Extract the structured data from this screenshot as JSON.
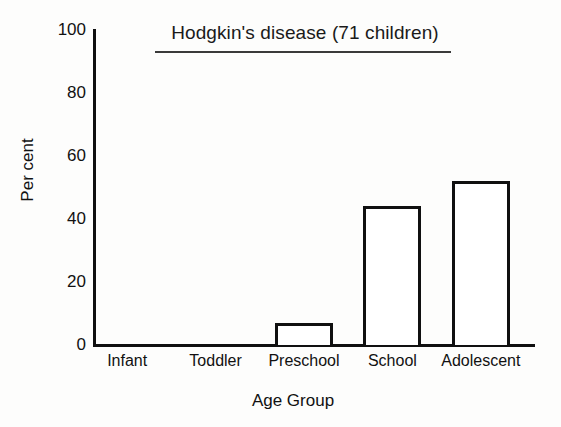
{
  "chart_data": {
    "type": "bar",
    "title": "Hodgkin's disease (71 children)",
    "xlabel": "Age Group",
    "ylabel": "Per cent",
    "categories": [
      "Infant",
      "Toddler",
      "Preschool",
      "School",
      "Adolescent"
    ],
    "values": [
      0,
      0,
      7,
      44,
      52
    ],
    "ylim": [
      0,
      100
    ],
    "yticks": [
      0,
      20,
      40,
      60,
      80,
      100
    ],
    "ytick_labels": [
      "0",
      "20",
      "40",
      "60",
      "80",
      "100"
    ],
    "grid": false,
    "legend": null,
    "bar_style": {
      "fill": "#ffffff",
      "edge": "#101010",
      "edge_width_px": 3
    },
    "axis_color": "#101010",
    "background": "#fdfdfc",
    "title_underlined": true
  }
}
